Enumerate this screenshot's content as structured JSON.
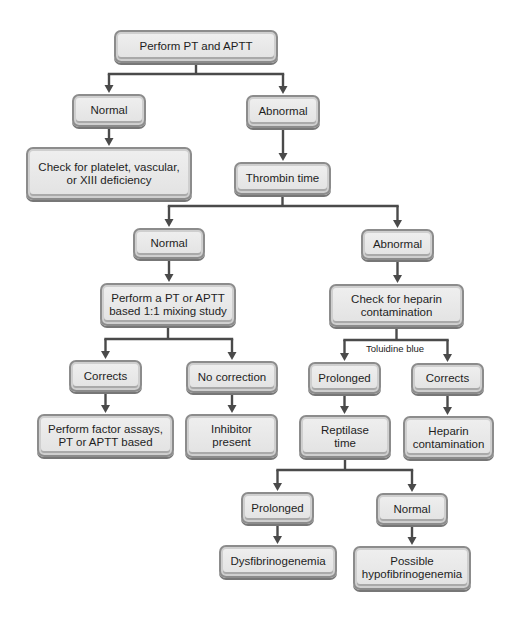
{
  "diagram": {
    "type": "flowchart",
    "line_color": "#4a4a4a",
    "box_fill": "#e6e6e6",
    "box_border": "#8c8c8c",
    "nodes": {
      "pt_aptt": {
        "label": "Perform PT and APTT",
        "x": 114,
        "y": 30,
        "w": 164,
        "h": 33
      },
      "normal_1": {
        "label": "Normal",
        "x": 72,
        "y": 94,
        "w": 74,
        "h": 33
      },
      "abnormal_1": {
        "label": "Abnormal",
        "x": 246,
        "y": 95,
        "w": 74,
        "h": 33
      },
      "check_platelet": {
        "label": "Check for platelet, vascular,\nor XIII deficiency",
        "x": 26,
        "y": 147,
        "w": 166,
        "h": 53
      },
      "thrombin_time": {
        "label": "Thrombin time",
        "x": 234,
        "y": 162,
        "w": 97,
        "h": 33
      },
      "normal_2": {
        "label": "Normal",
        "x": 133,
        "y": 228,
        "w": 72,
        "h": 31
      },
      "abnormal_2": {
        "label": "Abnormal",
        "x": 361,
        "y": 229,
        "w": 73,
        "h": 31
      },
      "mixing_study": {
        "label": "Perform a PT or APTT\nbased 1:1 mixing study",
        "x": 100,
        "y": 283,
        "w": 136,
        "h": 43
      },
      "check_heparin": {
        "label": "Check for heparin\ncontamination",
        "x": 329,
        "y": 284,
        "w": 135,
        "h": 43
      },
      "corrects_1": {
        "label": "Corrects",
        "x": 69,
        "y": 360,
        "w": 73,
        "h": 32
      },
      "no_correction": {
        "label": "No correction",
        "x": 186,
        "y": 361,
        "w": 92,
        "h": 32
      },
      "prolonged_1": {
        "label": "Prolonged",
        "x": 308,
        "y": 362,
        "w": 73,
        "h": 32
      },
      "corrects_2": {
        "label": "Corrects",
        "x": 411,
        "y": 363,
        "w": 73,
        "h": 31
      },
      "factor_assays": {
        "label": "Perform factor assays,\nPT or APTT based",
        "x": 37,
        "y": 414,
        "w": 137,
        "h": 43
      },
      "inhibitor_present": {
        "label": "Inhibitor\npresent",
        "x": 185,
        "y": 414,
        "w": 93,
        "h": 44
      },
      "reptilase_time": {
        "label": "Reptilase\ntime",
        "x": 299,
        "y": 415,
        "w": 92,
        "h": 43
      },
      "heparin_contamination": {
        "label": "Heparin\ncontamination",
        "x": 403,
        "y": 416,
        "w": 91,
        "h": 43
      },
      "prolonged_2": {
        "label": "Prolonged",
        "x": 241,
        "y": 492,
        "w": 73,
        "h": 32
      },
      "normal_3": {
        "label": "Normal",
        "x": 376,
        "y": 493,
        "w": 72,
        "h": 32
      },
      "dysfibrinogenemia": {
        "label": "Dysfibrinogenemia",
        "x": 219,
        "y": 545,
        "w": 118,
        "h": 33
      },
      "hypofibrinogenemia": {
        "label": "Possible\nhypofibrinogenemia",
        "x": 353,
        "y": 546,
        "w": 118,
        "h": 44
      }
    },
    "edge_labels": {
      "toluidine_blue": {
        "label": "Toluidine blue",
        "x": 366,
        "y": 343
      }
    },
    "edges": [
      {
        "from": "pt_aptt",
        "to": [
          "normal_1",
          "abnormal_1"
        ],
        "split_y": 74
      },
      {
        "from": "normal_1",
        "to": [
          "check_platelet"
        ]
      },
      {
        "from": "abnormal_1",
        "to": [
          "thrombin_time"
        ]
      },
      {
        "from": "thrombin_time",
        "to": [
          "normal_2",
          "abnormal_2"
        ],
        "split_y": 206
      },
      {
        "from": "normal_2",
        "to": [
          "mixing_study"
        ]
      },
      {
        "from": "abnormal_2",
        "to": [
          "check_heparin"
        ]
      },
      {
        "from": "mixing_study",
        "to": [
          "corrects_1",
          "no_correction"
        ],
        "split_y": 339
      },
      {
        "from": "check_heparin",
        "to": [
          "prolonged_1",
          "corrects_2"
        ],
        "split_y": 340,
        "label": "Toluidine blue"
      },
      {
        "from": "corrects_1",
        "to": [
          "factor_assays"
        ]
      },
      {
        "from": "no_correction",
        "to": [
          "inhibitor_present"
        ]
      },
      {
        "from": "prolonged_1",
        "to": [
          "reptilase_time"
        ]
      },
      {
        "from": "corrects_2",
        "to": [
          "heparin_contamination"
        ]
      },
      {
        "from": "reptilase_time",
        "to": [
          "prolonged_2",
          "normal_3"
        ],
        "split_y": 470
      },
      {
        "from": "prolonged_2",
        "to": [
          "dysfibrinogenemia"
        ]
      },
      {
        "from": "normal_3",
        "to": [
          "hypofibrinogenemia"
        ]
      }
    ]
  }
}
